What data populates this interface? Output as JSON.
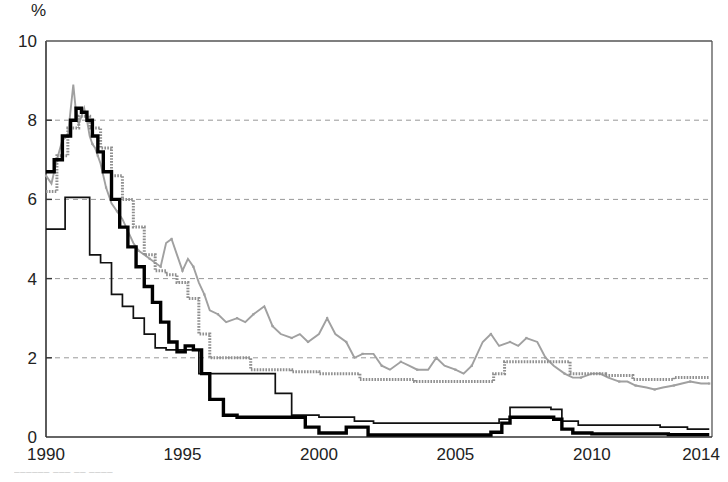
{
  "chart_data": {
    "type": "line",
    "title": "",
    "subtitle": "",
    "xlabel": "",
    "ylabel": "%",
    "unit_label": "%",
    "xlim": [
      1990,
      2014.4
    ],
    "ylim": [
      0,
      10
    ],
    "grid": "horizontal-dashed",
    "legend_position": "none",
    "y_ticks": [
      0,
      2,
      4,
      6,
      8,
      10
    ],
    "y_tick_labels": [
      "0",
      "2",
      "4",
      "6",
      "8",
      "10"
    ],
    "x_ticks": [
      1990,
      1995,
      2000,
      2005,
      2010,
      2014
    ],
    "x_tick_labels": [
      "1990",
      "1995",
      "2000",
      "2005",
      "2010",
      "2014"
    ],
    "series": [
      {
        "name": "series-gray-wavy",
        "style": "gray-thin-wavy",
        "color": "#a0a0a0",
        "x": [
          1990.0,
          1990.2,
          1990.4,
          1990.6,
          1990.8,
          1991.0,
          1991.1,
          1991.2,
          1991.3,
          1991.4,
          1991.5,
          1991.6,
          1991.7,
          1991.8,
          1991.9,
          1992.0,
          1992.2,
          1992.4,
          1992.6,
          1992.8,
          1993.0,
          1993.2,
          1993.4,
          1993.6,
          1993.8,
          1994.0,
          1994.2,
          1994.4,
          1994.6,
          1994.8,
          1995.0,
          1995.2,
          1995.4,
          1995.6,
          1995.8,
          1996.0,
          1996.3,
          1996.6,
          1997.0,
          1997.3,
          1997.6,
          1998.0,
          1998.3,
          1998.6,
          1999.0,
          1999.3,
          1999.6,
          2000.0,
          2000.3,
          2000.6,
          2001.0,
          2001.3,
          2001.6,
          2002.0,
          2002.3,
          2002.6,
          2003.0,
          2003.3,
          2003.6,
          2004.0,
          2004.3,
          2004.6,
          2005.0,
          2005.3,
          2005.6,
          2006.0,
          2006.3,
          2006.6,
          2007.0,
          2007.3,
          2007.6,
          2008.0,
          2008.3,
          2008.6,
          2009.0,
          2009.3,
          2009.6,
          2010.0,
          2010.3,
          2010.6,
          2011.0,
          2011.3,
          2011.6,
          2012.0,
          2012.3,
          2012.6,
          2013.0,
          2013.3,
          2013.6,
          2014.0,
          2014.3
        ],
        "y": [
          6.6,
          6.4,
          7.0,
          7.5,
          7.6,
          8.9,
          8.2,
          7.9,
          8.1,
          8.3,
          8.0,
          7.6,
          7.4,
          7.3,
          7.1,
          6.9,
          6.3,
          5.9,
          5.7,
          5.5,
          5.2,
          4.9,
          4.7,
          4.6,
          4.5,
          4.4,
          4.3,
          4.9,
          5.0,
          4.6,
          4.2,
          4.5,
          4.3,
          3.9,
          3.6,
          3.2,
          3.1,
          2.9,
          3.0,
          2.9,
          3.1,
          3.3,
          2.8,
          2.6,
          2.5,
          2.6,
          2.4,
          2.6,
          3.0,
          2.6,
          2.4,
          2.0,
          2.1,
          2.1,
          1.8,
          1.7,
          1.9,
          1.8,
          1.7,
          1.7,
          2.0,
          1.8,
          1.7,
          1.6,
          1.8,
          2.4,
          2.6,
          2.3,
          2.4,
          2.3,
          2.5,
          2.4,
          2.0,
          1.8,
          1.6,
          1.5,
          1.5,
          1.6,
          1.6,
          1.5,
          1.4,
          1.4,
          1.3,
          1.25,
          1.2,
          1.25,
          1.3,
          1.35,
          1.4,
          1.35,
          1.35
        ]
      },
      {
        "name": "series-gray-step",
        "style": "gray-dotted-step",
        "color": "#8f8f8f",
        "x": [
          1990.0,
          1990.4,
          1990.8,
          1991.2,
          1991.6,
          1992.0,
          1992.4,
          1992.8,
          1993.2,
          1993.6,
          1994.0,
          1994.4,
          1994.8,
          1995.2,
          1995.6,
          1996.0,
          1996.5,
          1997.5,
          1998.5,
          1999.0,
          2000.0,
          2001.0,
          2001.5,
          2002.5,
          2003.5,
          2004.5,
          2005.5,
          2006.4,
          2006.8,
          2008.6,
          2009.2,
          2010.5,
          2011.5,
          2012.5,
          2013.0,
          2014.3
        ],
        "y": [
          6.2,
          7.1,
          7.8,
          8.1,
          7.8,
          7.3,
          6.6,
          6.0,
          5.3,
          4.6,
          4.2,
          4.1,
          3.9,
          3.5,
          2.6,
          2.0,
          2.0,
          1.7,
          1.7,
          1.65,
          1.6,
          1.6,
          1.45,
          1.45,
          1.4,
          1.4,
          1.4,
          1.6,
          1.9,
          1.9,
          1.6,
          1.55,
          1.45,
          1.45,
          1.5,
          1.5
        ]
      },
      {
        "name": "series-black-thin-step",
        "style": "black-thin-step",
        "color": "#111111",
        "x": [
          1990.0,
          1990.3,
          1990.7,
          1991.0,
          1991.3,
          1991.6,
          1992.0,
          1992.4,
          1992.8,
          1993.2,
          1993.6,
          1994.0,
          1994.4,
          1994.8,
          1995.2,
          1995.6,
          1996.0,
          1996.5,
          1997.5,
          1998.4,
          1999.0,
          2000.0,
          2001.0,
          2001.3,
          2002.0,
          2003.0,
          2004.0,
          2005.0,
          2006.0,
          2006.6,
          2007.0,
          2007.4,
          2008.0,
          2008.5,
          2008.9,
          2009.5,
          2010.5,
          2011.5,
          2012.5,
          2013.5,
          2014.3
        ],
        "y": [
          5.25,
          5.25,
          6.05,
          6.05,
          6.05,
          4.6,
          4.4,
          3.6,
          3.3,
          3.0,
          2.6,
          2.25,
          2.2,
          2.2,
          2.2,
          1.6,
          1.6,
          1.6,
          1.6,
          1.1,
          0.55,
          0.5,
          0.5,
          0.4,
          0.35,
          0.35,
          0.35,
          0.35,
          0.35,
          0.45,
          0.75,
          0.75,
          0.75,
          0.7,
          0.4,
          0.3,
          0.3,
          0.3,
          0.25,
          0.2,
          0.2
        ]
      },
      {
        "name": "series-black-thick",
        "style": "black-thick",
        "color": "#000000",
        "x": [
          1990.0,
          1990.3,
          1990.6,
          1990.9,
          1991.1,
          1991.3,
          1991.5,
          1991.7,
          1991.9,
          1992.1,
          1992.4,
          1992.7,
          1993.0,
          1993.3,
          1993.6,
          1993.9,
          1994.2,
          1994.5,
          1994.8,
          1995.1,
          1995.4,
          1995.7,
          1996.0,
          1996.5,
          1997.0,
          1997.5,
          1998.0,
          1998.5,
          1999.0,
          1999.5,
          2000.0,
          2000.5,
          2001.0,
          2001.3,
          2001.8,
          2002.5,
          2003.5,
          2004.5,
          2005.5,
          2006.3,
          2006.7,
          2007.0,
          2007.5,
          2008.0,
          2008.6,
          2008.9,
          2009.3,
          2010.0,
          2011.0,
          2012.0,
          2012.8,
          2013.5,
          2014.3
        ],
        "y": [
          6.7,
          7.0,
          7.6,
          8.0,
          8.3,
          8.2,
          8.0,
          7.6,
          7.2,
          6.7,
          6.0,
          5.3,
          4.8,
          4.3,
          3.8,
          3.4,
          2.9,
          2.4,
          2.15,
          2.3,
          2.2,
          1.6,
          0.95,
          0.55,
          0.5,
          0.5,
          0.5,
          0.5,
          0.5,
          0.25,
          0.1,
          0.1,
          0.25,
          0.25,
          0.05,
          0.05,
          0.05,
          0.05,
          0.05,
          0.12,
          0.35,
          0.5,
          0.5,
          0.5,
          0.45,
          0.2,
          0.1,
          0.08,
          0.08,
          0.08,
          0.06,
          0.06,
          0.06
        ]
      }
    ]
  },
  "footnote": {
    "text": "––––––  ––– –– ––––"
  }
}
